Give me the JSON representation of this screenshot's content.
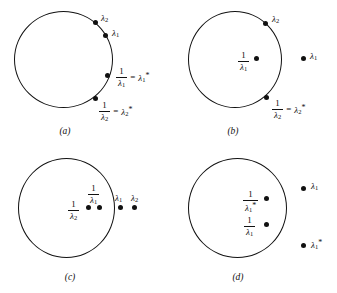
{
  "figure": {
    "type": "diagram",
    "lambda": "λ",
    "equals": "=",
    "star": "*",
    "one": "1"
  },
  "panels": [
    {
      "id": "a",
      "caption": "(a)",
      "points": [
        {
          "name": "lambda-2-on-circle",
          "label_base": "λ",
          "label_sub": "2",
          "label_star": "",
          "location": "on-circle"
        },
        {
          "name": "lambda-1-on-circle",
          "label_base": "λ",
          "label_sub": "1",
          "label_star": "",
          "location": "on-circle"
        },
        {
          "name": "recip-lambda-1-on-circle",
          "label_base": "λ",
          "label_sub": "1",
          "label_star": "*",
          "location": "on-circle"
        },
        {
          "name": "recip-lambda-2-on-circle",
          "label_base": "λ",
          "label_sub": "2",
          "label_star": "*",
          "location": "on-circle"
        }
      ],
      "labels": {
        "lambda2": {
          "base": "λ",
          "sub": "2"
        },
        "lambda1": {
          "base": "λ",
          "sub": "1"
        },
        "eq1_num": "1",
        "eq1_den_base": "λ",
        "eq1_den_sub": "1",
        "eq1_rhs_base": "λ",
        "eq1_rhs_sub": "1",
        "eq1_rhs_star": "*",
        "eq2_num": "1",
        "eq2_den_base": "λ",
        "eq2_den_sub": "2",
        "eq2_rhs_base": "λ",
        "eq2_rhs_sub": "2",
        "eq2_rhs_star": "*",
        "equals": "="
      }
    },
    {
      "id": "b",
      "caption": "(b)",
      "labels": {
        "lambda2": {
          "base": "λ",
          "sub": "2"
        },
        "lambda1": {
          "base": "λ",
          "sub": "1"
        },
        "inside_num": "1",
        "inside_den_base": "λ",
        "inside_den_sub": "1",
        "eq2_num": "1",
        "eq2_den_base": "λ",
        "eq2_den_sub": "2",
        "eq2_rhs_base": "λ",
        "eq2_rhs_sub": "2",
        "eq2_rhs_star": "*",
        "equals": "="
      }
    },
    {
      "id": "c",
      "caption": "(c)",
      "labels": {
        "recip2_num": "1",
        "recip2_den_base": "λ",
        "recip2_den_sub": "2",
        "recip1_num": "1",
        "recip1_den_base": "λ",
        "recip1_den_sub": "1",
        "lambda1": {
          "base": "λ",
          "sub": "1"
        },
        "lambda2": {
          "base": "λ",
          "sub": "2"
        }
      }
    },
    {
      "id": "d",
      "caption": "(d)",
      "labels": {
        "recip_star_num": "1",
        "recip_star_den_base": "λ",
        "recip_star_den_sub": "1",
        "recip_star_den_star": "*",
        "recip_num": "1",
        "recip_den_base": "λ",
        "recip_den_sub": "1",
        "lambda1": {
          "base": "λ",
          "sub": "1"
        },
        "lambda1star": {
          "base": "λ",
          "sub": "1",
          "star": "*"
        }
      }
    }
  ],
  "colors": {
    "ink": "#111111",
    "background": "#ffffff"
  }
}
